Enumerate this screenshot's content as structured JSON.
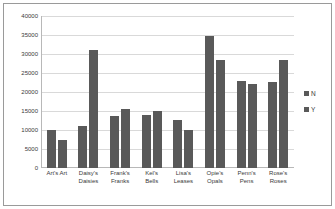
{
  "chart_data": {
    "type": "bar",
    "title": "",
    "xlabel": "",
    "ylabel": "",
    "ylim": [
      0,
      40000
    ],
    "ytick_labels": [
      "40000",
      "35000",
      "30000",
      "25000",
      "20000",
      "15000",
      "10000",
      "5000",
      "0"
    ],
    "yticks": [
      40000,
      35000,
      30000,
      25000,
      20000,
      15000,
      10000,
      5000,
      0
    ],
    "grid": true,
    "legend_position": "right",
    "categories": [
      "Art's Art",
      "Daisy's Daisies",
      "Frank's Franks",
      "Kel's Bells",
      "Lisa's Leases",
      "Opie's Opals",
      "Penn's Pens",
      "Rose's Roses"
    ],
    "category_lines": [
      "Art's Art",
      "Daisy's\nDaisies",
      "Frank's\nFranks",
      "Kel's\nBells",
      "Lisa's\nLeases",
      "Opie's\nOpals",
      "Penn's\nPens",
      "Rose's\nRoses"
    ],
    "series": [
      {
        "name": "N",
        "color": "#595959",
        "values": [
          10000,
          11000,
          13700,
          14000,
          12700,
          34700,
          22900,
          22600
        ]
      },
      {
        "name": "Y",
        "color": "#595959",
        "values": [
          7400,
          31000,
          15500,
          14900,
          9900,
          28500,
          22100,
          28300
        ]
      }
    ]
  },
  "legend": {
    "items": [
      {
        "label": "N",
        "swatch": "legend-swatch-n"
      },
      {
        "label": "Y",
        "swatch": "legend-swatch-y"
      }
    ]
  }
}
